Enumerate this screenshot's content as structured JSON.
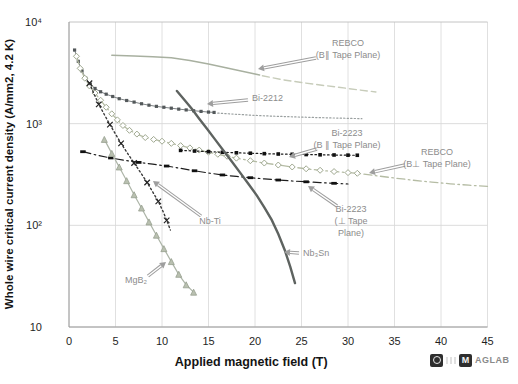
{
  "figure": {
    "background": "#ffffff",
    "grid_color": "#d8d8d8",
    "axis_color": "#9a9a9a",
    "tick_color": "#1f1f1f",
    "label_color": "#8c8c8c"
  },
  "logo": {
    "m": "M",
    "text": "AGLAB"
  },
  "chart_data": {
    "type": "line",
    "title": "",
    "xlabel": "Applied magnetic field (T)",
    "ylabel": "Whole wire critical current density (A/mm2, 4.2 K)",
    "xlim": [
      0,
      45
    ],
    "ylog_lim": [
      1,
      4
    ],
    "grid": true,
    "x_ticks": [
      0,
      5,
      10,
      15,
      20,
      25,
      30,
      35,
      40,
      45
    ],
    "y_ticks": [
      {
        "v": 10,
        "label": "10"
      },
      {
        "v": 100,
        "label": "10²"
      },
      {
        "v": 1000,
        "label": "10³"
      },
      {
        "v": 10000,
        "label": "10⁴"
      }
    ],
    "series": [
      {
        "id": "rebco-parallel-measured",
        "name": "REBCO (B∥ Tape Plane) measured",
        "color": "#a8b0a0",
        "width": 1.5,
        "style": "solid",
        "marker": "none",
        "points": [
          [
            4.6,
            4700
          ],
          [
            7,
            4620
          ],
          [
            9,
            4560
          ],
          [
            11,
            4440
          ],
          [
            13,
            4180
          ],
          [
            15,
            3860
          ],
          [
            17,
            3520
          ],
          [
            18.5,
            3300
          ],
          [
            20,
            3080
          ],
          [
            20.5,
            3020
          ]
        ]
      },
      {
        "id": "rebco-parallel-extrapolated",
        "name": "REBCO (B∥ Tape Plane) extrapolated",
        "color": "#c7ccba",
        "width": 1.4,
        "style": "dashed",
        "marker": "none",
        "points": [
          [
            20.8,
            2960
          ],
          [
            23,
            2700
          ],
          [
            25,
            2540
          ],
          [
            27,
            2400
          ],
          [
            29,
            2280
          ],
          [
            31,
            2160
          ],
          [
            33,
            2050
          ]
        ]
      },
      {
        "id": "bi2212-measured",
        "name": "Bi-2212 measured",
        "color": "#7d8284",
        "width": 1.0,
        "style": "solid",
        "marker": "square",
        "marker_color": "#53585a",
        "marker_size": 3.2,
        "points": [
          [
            0.6,
            5300
          ],
          [
            1,
            4100
          ],
          [
            1.4,
            3300
          ],
          [
            1.8,
            2800
          ],
          [
            2.3,
            2450
          ],
          [
            2.8,
            2220
          ],
          [
            3.4,
            2060
          ],
          [
            4,
            1950
          ],
          [
            4.7,
            1850
          ],
          [
            5.4,
            1760
          ],
          [
            6.2,
            1690
          ],
          [
            7,
            1630
          ],
          [
            7.8,
            1570
          ],
          [
            8.6,
            1520
          ],
          [
            9.4,
            1480
          ],
          [
            10.2,
            1450
          ],
          [
            11,
            1420
          ],
          [
            11.8,
            1390
          ],
          [
            12.6,
            1365
          ],
          [
            13.4,
            1340
          ],
          [
            14.2,
            1320
          ],
          [
            15,
            1300
          ],
          [
            15.6,
            1290
          ]
        ]
      },
      {
        "id": "bi2212-extrapolated",
        "name": "Bi-2212 extrapolated",
        "color": "#9aa0a0",
        "width": 1.2,
        "style": "finedot",
        "marker": "none",
        "points": [
          [
            16,
            1270
          ],
          [
            18,
            1235
          ],
          [
            20,
            1205
          ],
          [
            22,
            1185
          ],
          [
            24,
            1168
          ],
          [
            26,
            1152
          ],
          [
            28,
            1140
          ],
          [
            30,
            1128
          ],
          [
            31.5,
            1120
          ]
        ]
      },
      {
        "id": "rebco-perpendicular",
        "name": "REBCO (B⊥ Tape Plane)",
        "color": "#b5bca4",
        "width": 1.3,
        "style": "dashdot",
        "marker": "diamond",
        "marker_color": "#9fa890",
        "marker_size": 4,
        "markers_until": 31,
        "points": [
          [
            0.8,
            4600
          ],
          [
            1.2,
            3500
          ],
          [
            1.7,
            2800
          ],
          [
            2.2,
            2350
          ],
          [
            2.8,
            2000
          ],
          [
            3.4,
            1700
          ],
          [
            4,
            1450
          ],
          [
            4.6,
            1250
          ],
          [
            5.2,
            1090
          ],
          [
            5.8,
            960
          ],
          [
            6.5,
            860
          ],
          [
            7.3,
            790
          ],
          [
            8.2,
            730
          ],
          [
            9.1,
            700
          ],
          [
            10,
            672
          ],
          [
            11,
            640
          ],
          [
            12,
            608
          ],
          [
            13,
            578
          ],
          [
            14,
            550
          ],
          [
            15,
            524
          ],
          [
            16,
            500
          ],
          [
            17,
            478
          ],
          [
            18,
            458
          ],
          [
            19.5,
            432
          ],
          [
            21,
            410
          ],
          [
            22.5,
            392
          ],
          [
            24,
            375
          ],
          [
            25.5,
            360
          ],
          [
            27,
            348
          ],
          [
            28.5,
            338
          ],
          [
            30,
            330
          ],
          [
            31,
            325
          ],
          [
            33,
            308
          ],
          [
            35,
            292
          ],
          [
            37,
            278
          ],
          [
            39,
            266
          ],
          [
            41,
            256
          ],
          [
            43,
            248
          ],
          [
            45,
            242
          ]
        ]
      },
      {
        "id": "bi2223-parallel",
        "name": "Bi-2223 (B ∥ Tape Plane)",
        "color": "#1d1d1d",
        "width": 1.2,
        "style": "dotted",
        "marker": "fsquare",
        "marker_color": "#111111",
        "marker_size": 3.6,
        "points": [
          [
            12,
            546
          ],
          [
            13.5,
            538
          ],
          [
            15,
            530
          ],
          [
            16.5,
            523
          ],
          [
            18,
            517
          ],
          [
            19.5,
            512
          ],
          [
            21,
            507
          ],
          [
            22.5,
            503
          ],
          [
            24,
            500
          ],
          [
            25.5,
            497
          ],
          [
            27,
            494
          ],
          [
            28.5,
            492
          ],
          [
            30,
            490
          ],
          [
            31,
            489
          ]
        ]
      },
      {
        "id": "bi2223-perpendicular",
        "name": "Bi-2223 (⊥ Tape Plane)",
        "color": "#1d1d1d",
        "width": 1.2,
        "style": "dashdot",
        "marker": "hdash",
        "marker_color": "#111111",
        "marker_size": 5.5,
        "marker_every": 2,
        "points": [
          [
            1.5,
            530
          ],
          [
            3,
            490
          ],
          [
            4.5,
            460
          ],
          [
            6,
            436
          ],
          [
            7.5,
            416
          ],
          [
            9,
            399
          ],
          [
            10.5,
            383
          ],
          [
            12,
            364
          ],
          [
            13.5,
            344
          ],
          [
            15,
            327
          ],
          [
            16.5,
            313
          ],
          [
            18,
            303
          ],
          [
            19.5,
            294
          ],
          [
            21,
            286
          ],
          [
            22.5,
            279
          ],
          [
            24,
            273
          ],
          [
            25.5,
            268
          ],
          [
            27,
            263
          ],
          [
            28.5,
            259
          ],
          [
            30,
            255
          ]
        ]
      },
      {
        "id": "nbti",
        "name": "Nb-Ti",
        "color": "#3a3a3a",
        "width": 1.4,
        "style": "dotted",
        "marker": "x",
        "marker_color": "#242424",
        "marker_size": 5.5,
        "marker_every": 2,
        "points": [
          [
            2.2,
            2500
          ],
          [
            2.7,
            1950
          ],
          [
            3.2,
            1550
          ],
          [
            3.8,
            1230
          ],
          [
            4.4,
            980
          ],
          [
            5,
            790
          ],
          [
            5.6,
            640
          ],
          [
            6.3,
            510
          ],
          [
            7,
            410
          ],
          [
            7.7,
            330
          ],
          [
            8.4,
            264
          ],
          [
            9,
            213
          ],
          [
            9.6,
            172
          ],
          [
            10.1,
            138
          ],
          [
            10.5,
            112
          ],
          [
            10.9,
            90
          ]
        ]
      },
      {
        "id": "nb3sn",
        "name": "Nb₃Sn",
        "color": "#5e6360",
        "width": 2.4,
        "style": "solid",
        "marker": "none",
        "points": [
          [
            11.6,
            2100
          ],
          [
            12.4,
            1720
          ],
          [
            13.2,
            1400
          ],
          [
            14,
            1120
          ],
          [
            14.8,
            900
          ],
          [
            15.7,
            700
          ],
          [
            16.6,
            545
          ],
          [
            17.5,
            425
          ],
          [
            18.4,
            330
          ],
          [
            19.3,
            255
          ],
          [
            20.2,
            196
          ],
          [
            21,
            150
          ],
          [
            21.8,
            113
          ],
          [
            22.5,
            82
          ],
          [
            23.2,
            57
          ],
          [
            23.8,
            39
          ],
          [
            24.3,
            27
          ]
        ]
      },
      {
        "id": "mgb2",
        "name": "MgB₂",
        "color": "#adb5a8",
        "width": 1.2,
        "style": "solid",
        "marker": "triangle",
        "marker_color": "#97a08f",
        "marker_fill": "#b9c0b0",
        "marker_size": 4,
        "points": [
          [
            3.8,
            700
          ],
          [
            4.6,
            510
          ],
          [
            5.4,
            375
          ],
          [
            6.2,
            275
          ],
          [
            7,
            200
          ],
          [
            7.8,
            148
          ],
          [
            8.6,
            108
          ],
          [
            9.4,
            80
          ],
          [
            10.2,
            59
          ],
          [
            11,
            44
          ],
          [
            11.8,
            33
          ],
          [
            12.6,
            26
          ],
          [
            13.4,
            22
          ]
        ]
      }
    ],
    "annotations": [
      {
        "id": "rebco-parallel-label",
        "lines": [
          "REBCO",
          "(B∥ Tape Plane)"
        ],
        "x": 348,
        "y": 46,
        "anchor": "middle",
        "arrow": {
          "x1": 316,
          "y1": 58,
          "x2": 258,
          "y2": 69
        }
      },
      {
        "id": "bi2212-label",
        "lines": [
          "Bi-2212"
        ],
        "x": 252,
        "y": 101,
        "anchor": "start",
        "arrow": {
          "x1": 248,
          "y1": 100,
          "x2": 207,
          "y2": 104
        }
      },
      {
        "id": "bi2223-parallel-label",
        "lines": [
          "Bi-2223",
          "(B ∥ Tape Plane)"
        ],
        "x": 347,
        "y": 136,
        "anchor": "middle",
        "arrow": {
          "x1": 317,
          "y1": 149,
          "x2": 289,
          "y2": 157
        }
      },
      {
        "id": "rebco-perpendicular-label",
        "lines": [
          "REBCO",
          "(B⊥ Tape Plane)"
        ],
        "x": 437,
        "y": 155,
        "anchor": "middle",
        "arrow": {
          "x1": 405,
          "y1": 165,
          "x2": 369,
          "y2": 173
        }
      },
      {
        "id": "bi2223-perpendicular-label",
        "lines": [
          "Bi-2223",
          "(⊥ Tape",
          "Plane)"
        ],
        "x": 351,
        "y": 212,
        "anchor": "middle",
        "arrow": {
          "x1": 337,
          "y1": 206,
          "x2": 308,
          "y2": 186
        }
      },
      {
        "id": "nbti-label",
        "lines": [
          "Nb-Ti"
        ],
        "x": 210,
        "y": 224,
        "anchor": "middle",
        "arrow": {
          "x1": 201,
          "y1": 216,
          "x2": 153,
          "y2": 181
        }
      },
      {
        "id": "nb3sn-label",
        "lines": [
          "Nb₃Sn"
        ],
        "x": 303,
        "y": 256,
        "anchor": "start",
        "arrow": {
          "x1": 299,
          "y1": 253,
          "x2": 284,
          "y2": 252
        }
      },
      {
        "id": "mgb2-label",
        "lines": [
          "MgB₂"
        ],
        "x": 136,
        "y": 283,
        "anchor": "middle",
        "arrow": {
          "x1": 148,
          "y1": 276,
          "x2": 166,
          "y2": 262
        }
      }
    ]
  }
}
